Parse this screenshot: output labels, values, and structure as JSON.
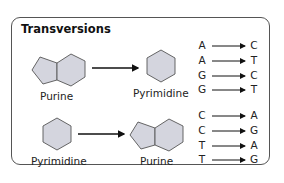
{
  "title": "Transversions",
  "top": {
    "from_label": "Purine",
    "to_label": "Pyrimidine",
    "pairs": [
      {
        "from": "A",
        "to": "C"
      },
      {
        "from": "A",
        "to": "T"
      },
      {
        "from": "G",
        "to": "C"
      },
      {
        "from": "G",
        "to": "T"
      }
    ]
  },
  "bottom": {
    "from_label": "Pyrimidine",
    "to_label": "Purine",
    "pairs": [
      {
        "from": "C",
        "to": "A"
      },
      {
        "from": "C",
        "to": "G"
      },
      {
        "from": "T",
        "to": "A"
      },
      {
        "from": "T",
        "to": "G"
      }
    ]
  },
  "colors": {
    "shape_fill": "#d4d5de",
    "shape_stroke": "#555555",
    "arrow": "#111111"
  }
}
